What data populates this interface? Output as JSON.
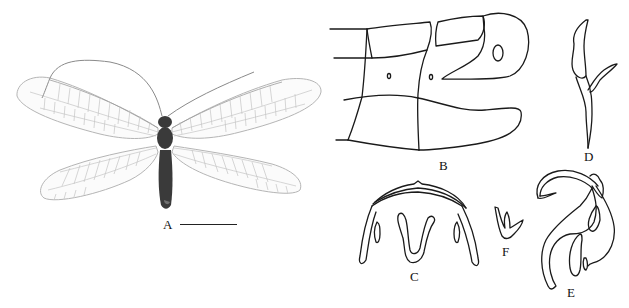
{
  "figure": {
    "panels": [
      {
        "id": "A",
        "label": "A",
        "content": "habitus photograph of lacewing specimen, dorsal view, wings spread",
        "has_scale_bar": true
      },
      {
        "id": "B",
        "label": "B",
        "content": "line drawing of abdominal terminal segments, lateral view"
      },
      {
        "id": "C",
        "label": "C",
        "content": "line drawing of genital structure, arched shape with inner U-shaped process"
      },
      {
        "id": "D",
        "label": "D",
        "content": "line drawing of slender forked structure"
      },
      {
        "id": "E",
        "label": "E",
        "content": "line drawing of curved genital structure, lateral view"
      },
      {
        "id": "F",
        "label": "F",
        "content": "small line drawing of three-pronged structure"
      }
    ],
    "colors": {
      "ink": "#1a1a1a",
      "background": "#ffffff",
      "wing_vein": "#c4c4c4",
      "body": "#3a3a3a"
    }
  }
}
